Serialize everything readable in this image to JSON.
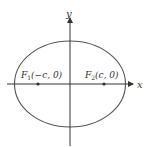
{
  "diagram": {
    "type": "ellipse-with-foci",
    "axes": {
      "x_label": "x",
      "y_label": "y"
    },
    "foci": [
      {
        "label_main": "F",
        "label_sub": "1",
        "label_coords": "(−c, 0)"
      },
      {
        "label_main": "F",
        "label_sub": "2",
        "label_coords": "(c, 0)"
      }
    ],
    "colors": {
      "stroke": "#444444",
      "text": "#333333",
      "background": "#ffffff"
    }
  }
}
